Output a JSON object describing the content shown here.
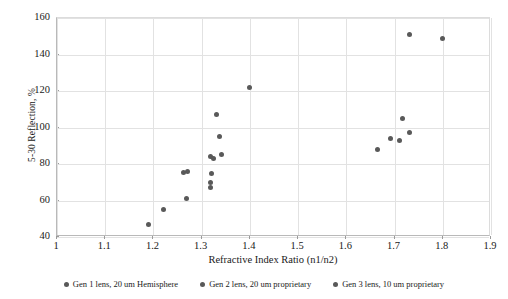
{
  "chart_data": {
    "type": "scatter",
    "title": "",
    "xlabel": "Refractive Index Ratio (n1/n2)",
    "ylabel": "5-30 Reflection, %",
    "xlim": [
      1,
      1.9
    ],
    "ylim": [
      40,
      160
    ],
    "xticks": [
      "1",
      "1.1",
      "1.2",
      "1.3",
      "1.4",
      "1.5",
      "1.6",
      "1.7",
      "1.8",
      "1.9"
    ],
    "xtick_values": [
      1,
      1.1,
      1.2,
      1.3,
      1.4,
      1.5,
      1.6,
      1.7,
      1.8,
      1.9
    ],
    "yticks": [
      "40",
      "60",
      "80",
      "100",
      "120",
      "140",
      "160"
    ],
    "ytick_values": [
      40,
      60,
      80,
      100,
      120,
      140,
      160
    ],
    "grid": true,
    "grid_color": "#e2e2e2",
    "legend_position": "bottom",
    "marker_color": "#595959",
    "series": [
      {
        "name": "Gen 1 lens, 20 um Hemisphere",
        "color": "#595959",
        "points": [
          {
            "x": 1.19,
            "y": 47
          },
          {
            "x": 1.221,
            "y": 55
          },
          {
            "x": 1.268,
            "y": 61
          },
          {
            "x": 1.262,
            "y": 75.5
          },
          {
            "x": 1.271,
            "y": 76
          }
        ]
      },
      {
        "name": "Gen 2 lens, 20 um proprietary",
        "color": "#595959",
        "points": [
          {
            "x": 1.318,
            "y": 67
          },
          {
            "x": 1.318,
            "y": 70
          },
          {
            "x": 1.321,
            "y": 75
          },
          {
            "x": 1.318,
            "y": 84
          },
          {
            "x": 1.341,
            "y": 85
          },
          {
            "x": 1.325,
            "y": 83
          },
          {
            "x": 1.337,
            "y": 95
          },
          {
            "x": 1.331,
            "y": 107
          },
          {
            "x": 1.399,
            "y": 122
          }
        ]
      },
      {
        "name": "Gen 3 lens, 10 um proprietary",
        "color": "#595959",
        "points": [
          {
            "x": 1.664,
            "y": 88
          },
          {
            "x": 1.691,
            "y": 94
          },
          {
            "x": 1.711,
            "y": 93
          },
          {
            "x": 1.716,
            "y": 105
          },
          {
            "x": 1.731,
            "y": 97
          },
          {
            "x": 1.731,
            "y": 151
          },
          {
            "x": 1.799,
            "y": 149
          }
        ]
      }
    ]
  }
}
